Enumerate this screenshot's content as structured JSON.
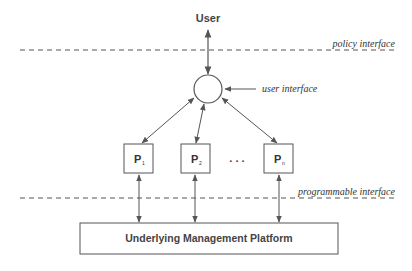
{
  "diagram": {
    "top_node": {
      "label": "User"
    },
    "interfaces": {
      "policy": {
        "label": "policy interface"
      },
      "user": {
        "label": "user interface"
      },
      "programmable": {
        "label": "programmable interface"
      }
    },
    "processes": [
      {
        "label": "P",
        "subscript": "1"
      },
      {
        "label": "P",
        "subscript": "2"
      },
      {
        "label": "P",
        "subscript": "n"
      }
    ],
    "ellipsis": ". . .",
    "platform": {
      "label": "Underlying Management Platform"
    },
    "colors": {
      "stroke": "#555555",
      "text": "#333333",
      "background": "#ffffff"
    }
  }
}
